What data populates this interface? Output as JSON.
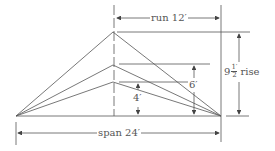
{
  "diagram": {
    "type": "roof pitch diagram",
    "labels": {
      "run": "run 12′",
      "span": "span 24′",
      "rise_whole": "9",
      "rise_num": "1′",
      "rise_den": "2",
      "rise_word": "rise",
      "mid_rise": "6′",
      "low_rise": "4′"
    },
    "rises": [
      "4′",
      "6′",
      "9 1/2′"
    ],
    "line_color": "#555555"
  }
}
